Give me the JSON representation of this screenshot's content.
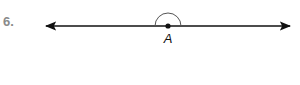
{
  "problem": {
    "number": "6."
  },
  "diagram": {
    "type": "line with angle arc",
    "point_label": "A",
    "line": {
      "x1": 46,
      "x2": 290,
      "y": 26,
      "arrows": "both"
    },
    "point": {
      "x": 168,
      "y": 26
    },
    "arc": {
      "radius": 13,
      "from_deg": 180,
      "to_deg": 0,
      "side": "above"
    },
    "colors": {
      "line": "#111111",
      "arc": "#555555",
      "number": "#8a8a8a"
    }
  }
}
